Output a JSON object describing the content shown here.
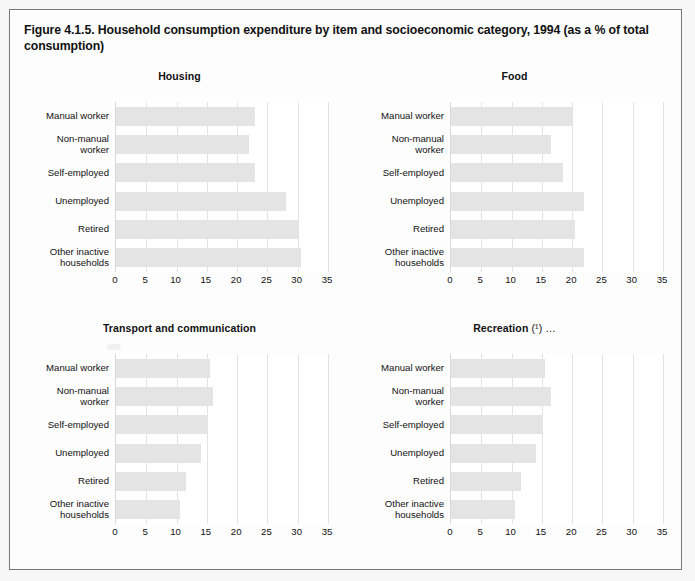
{
  "figure": {
    "title": "Figure 4.1.5. Household consumption expenditure by item and socioeconomic category, 1994 (as a % of total consumption)"
  },
  "axis": {
    "ticks": [
      "0",
      "5",
      "10",
      "15",
      "20",
      "25",
      "30",
      "35"
    ],
    "min": 0,
    "max": 35,
    "step": 5
  },
  "categories": [
    "Manual worker",
    "Non-manual\nworker",
    "Self-employed",
    "Unemployed",
    "Retired",
    "Other inactive\nhouseholds"
  ],
  "chart_data": [
    {
      "type": "bar",
      "orientation": "horizontal",
      "title": "Housing",
      "title_note": "",
      "categories": [
        "Manual worker",
        "Non-manual worker",
        "Self-employed",
        "Unemployed",
        "Retired",
        "Other inactive households"
      ],
      "values": [
        23,
        22,
        23,
        28,
        30,
        30.5
      ],
      "xlabel": "",
      "ylabel": "",
      "xlim": [
        0,
        35
      ],
      "grid": true,
      "legend": "none",
      "bar_color": "#e4e4e4"
    },
    {
      "type": "bar",
      "orientation": "horizontal",
      "title": "Food",
      "title_note": "",
      "categories": [
        "Manual worker",
        "Non-manual worker",
        "Self-employed",
        "Unemployed",
        "Retired",
        "Other inactive households"
      ],
      "values": [
        20,
        16.5,
        18.5,
        22,
        20.5,
        22
      ],
      "xlabel": "",
      "ylabel": "",
      "xlim": [
        0,
        35
      ],
      "grid": true,
      "legend": "none",
      "bar_color": "#e4e4e4"
    },
    {
      "type": "bar",
      "orientation": "horizontal",
      "title": "Transport and communication",
      "title_note": "",
      "categories": [
        "Manual worker",
        "Non-manual worker",
        "Self-employed",
        "Unemployed",
        "Retired",
        "Other inactive households"
      ],
      "values": [
        15.5,
        16,
        15,
        14,
        11.5,
        10.5
      ],
      "xlabel": "",
      "ylabel": "",
      "xlim": [
        0,
        35
      ],
      "grid": true,
      "legend": "none",
      "bar_color": "#e4e4e4"
    },
    {
      "type": "bar",
      "orientation": "horizontal",
      "title": "Recreation",
      "title_note": "(¹) …",
      "categories": [
        "Manual worker",
        "Non-manual worker",
        "Self-employed",
        "Unemployed",
        "Retired",
        "Other inactive households"
      ],
      "values": [
        15.5,
        16.5,
        15,
        14,
        11.5,
        10.5
      ],
      "xlabel": "",
      "ylabel": "",
      "xlim": [
        0,
        35
      ],
      "grid": true,
      "legend": "none",
      "bar_color": "#e4e4e4"
    }
  ],
  "colors": {
    "page_background": "#f7f7f7",
    "figure_background": "#fdfdfd",
    "figure_border": "#777777",
    "plot_background": "#ffffff",
    "gridline": "#e3e3e3",
    "bar": "#e4e4e4",
    "text": "#111111"
  }
}
